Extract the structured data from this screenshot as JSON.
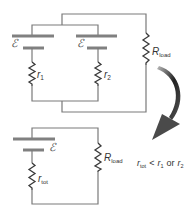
{
  "top_circuit": {
    "emf1_label": "ℰ",
    "emf2_label": "ℰ",
    "r1_label": "r",
    "r1_sub": "1",
    "r2_label": "r",
    "r2_sub": "2",
    "rload_label": "R",
    "rload_sub": "load"
  },
  "bottom_circuit": {
    "emf_label": "ℰ",
    "rtot_label": "r",
    "rtot_sub": "tot",
    "rload_label": "R",
    "rload_sub": "load"
  },
  "relation": {
    "lhs": "r",
    "lhs_sub": "tot",
    "op": "<",
    "a": "r",
    "a_sub": "1",
    "conj": "or",
    "b": "r",
    "b_sub": "2"
  },
  "arrow": {
    "direction": "top-circuit-to-bottom-circuit",
    "color": "#333333"
  }
}
